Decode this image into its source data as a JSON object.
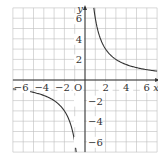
{
  "chart_data": {
    "type": "line",
    "title": "",
    "function": "y = 6/x",
    "xlabel": "x",
    "ylabel": "y",
    "origin_label": "O",
    "xlim": [
      -7,
      7
    ],
    "ylim": [
      -7,
      7
    ],
    "grid": true,
    "x_ticks": [
      -6,
      -4,
      -2,
      2,
      4,
      6
    ],
    "x_tick_labels": [
      "−6",
      "−4",
      "−2",
      "2",
      "4",
      "6"
    ],
    "y_ticks": [
      6,
      4,
      2,
      -2,
      -4,
      -6
    ],
    "y_tick_labels": [
      "6",
      "4",
      "2",
      "−2",
      "−4",
      "−6"
    ],
    "series": [
      {
        "name": "y=6/x (x>0)",
        "x": [
          0.857,
          1,
          1.5,
          2,
          3,
          4,
          5,
          6,
          7
        ],
        "y": [
          7,
          6,
          4,
          3,
          2,
          1.5,
          1.2,
          1,
          0.857
        ]
      },
      {
        "name": "y=6/x (x<0)",
        "x": [
          -7,
          -6,
          -5,
          -4,
          -3,
          -2,
          -1.5,
          -1,
          -0.857
        ],
        "y": [
          -0.857,
          -1,
          -1.2,
          -1.5,
          -2,
          -3,
          -4,
          -6,
          -7
        ]
      }
    ],
    "colors": {
      "grid": "#bdbdbd",
      "axis": "#333333",
      "curve": "#333333",
      "text": "#333333"
    }
  }
}
